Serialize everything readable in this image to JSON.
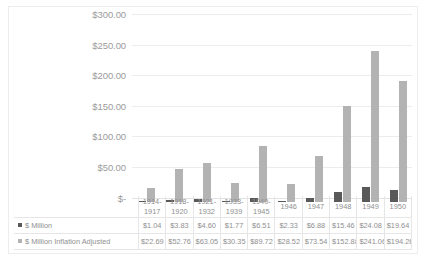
{
  "chart_data": {
    "type": "bar",
    "title": "",
    "subtitle": "",
    "xlabel": "",
    "ylabel": "",
    "ylim": [
      0,
      300
    ],
    "y_tick_labels": [
      "$300.00",
      "$250.00",
      "$200.00",
      "$150.00",
      "$100.00",
      "$50.00",
      "$-"
    ],
    "y_tick_values": [
      300,
      250,
      200,
      150,
      100,
      50,
      0
    ],
    "grid": true,
    "legend_position": "data-table",
    "categories": [
      "1914-1917",
      "1918-1920",
      "1921-1932",
      "1933-1939",
      "1940-1945",
      "1946",
      "1947",
      "1948",
      "1949",
      "1950"
    ],
    "category_lines": [
      [
        "1914-",
        "1917"
      ],
      [
        "1918-",
        "1920"
      ],
      [
        "1921-",
        "1932"
      ],
      [
        "1933-",
        "1939"
      ],
      [
        "1940-",
        "1945"
      ],
      [
        "1946",
        ""
      ],
      [
        "1947",
        ""
      ],
      [
        "1948",
        ""
      ],
      [
        "1949",
        ""
      ],
      [
        "1950",
        ""
      ]
    ],
    "series": [
      {
        "name": "$ Million",
        "color": "#595959",
        "values": [
          1.04,
          3.83,
          4.6,
          1.77,
          6.51,
          2.33,
          6.88,
          15.46,
          24.08,
          19.64
        ],
        "labels": [
          "$1.04",
          "$3.83",
          "$4.60",
          "$1.77",
          "$6.51",
          "$2.33",
          "$6.88",
          "$15.46",
          "$24.08",
          "$19.64"
        ]
      },
      {
        "name": "$ Million Inflation Adjusted",
        "color": "#b3b3b3",
        "values": [
          22.69,
          52.76,
          63.05,
          30.35,
          89.72,
          28.52,
          73.54,
          152.88,
          241.06,
          194.26
        ],
        "labels": [
          "$22.69",
          "$52.76",
          "$63.05",
          "$30.35",
          "$89.72",
          "$28.52",
          "$73.54",
          "$152.88",
          "$241.06",
          "$194.26"
        ]
      }
    ]
  },
  "colors": {
    "series_1": "#595959",
    "series_2": "#b3b3b3",
    "gridline": "#ececec",
    "axis_text": "#9b9b9b",
    "table_border": "#e6e6e6",
    "background": "#ffffff"
  }
}
